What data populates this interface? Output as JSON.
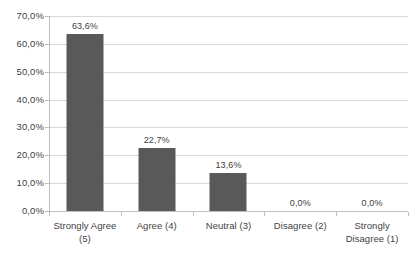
{
  "chart_data": {
    "type": "bar",
    "title": "",
    "subtitle": "",
    "xlabel": "",
    "ylabel": "",
    "categories": [
      "Strongly Agree (5)",
      "Agree (4)",
      "Neutral (3)",
      "Disagree (2)",
      "Strongly Disagree (1)"
    ],
    "category_lines": [
      [
        "Strongly Agree",
        "(5)"
      ],
      [
        "Agree (4)"
      ],
      [
        "Neutral (3)"
      ],
      [
        "Disagree (2)"
      ],
      [
        "Strongly",
        "Disagree (1)"
      ]
    ],
    "values": [
      63.6,
      22.7,
      13.6,
      0.0,
      0.0
    ],
    "data_labels": [
      "63,6%",
      "22,7%",
      "13,6%",
      "0,0%",
      "0,0%"
    ],
    "ylim": [
      0,
      70
    ],
    "ytick_values": [
      0,
      10,
      20,
      30,
      40,
      50,
      60,
      70
    ],
    "ytick_labels": [
      "0,0%",
      "10,0%",
      "20,0%",
      "30,0%",
      "40,0%",
      "50,0%",
      "60,0%",
      "70,0%"
    ],
    "grid": "horizontal",
    "legend": "none",
    "decimal_separator": ",",
    "bar_color": "#595959",
    "gridline_color": "#d9d9d9",
    "axis_color": "#bfbfbf",
    "text_color": "#3f3f3f",
    "background": "#ffffff"
  }
}
